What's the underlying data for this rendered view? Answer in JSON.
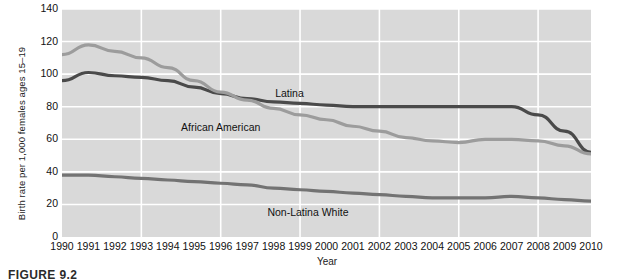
{
  "figure": {
    "caption": "FIGURE 9.2"
  },
  "chart_data": {
    "type": "line",
    "title": "",
    "xlabel": "Year",
    "ylabel": "Birth rate per 1,000 females ages 15–19",
    "xlim": [
      1990,
      2010
    ],
    "ylim": [
      0,
      140
    ],
    "yticks": [
      140,
      120,
      100,
      80,
      60,
      40,
      20,
      0
    ],
    "grid": true,
    "grid_color": "#ffffff",
    "plot_background": "#d9d9d9",
    "legend": "inline-labels",
    "x": [
      1990,
      1991,
      1992,
      1993,
      1994,
      1995,
      1996,
      1997,
      1998,
      1999,
      2000,
      2001,
      2002,
      2003,
      2004,
      2005,
      2006,
      2007,
      2008,
      2009,
      2010
    ],
    "categories": [
      "1990",
      "1991",
      "1992",
      "1993",
      "1994",
      "1995",
      "1996",
      "1997",
      "1998",
      "1999",
      "2000",
      "2001",
      "2002",
      "2003",
      "2004",
      "2005",
      "2006",
      "2007",
      "2008",
      "2009",
      "2010"
    ],
    "series": [
      {
        "name": "Latina",
        "color": "#4a4a4a",
        "label_x": 1998.6,
        "label_y": 88,
        "values": [
          96,
          101,
          99,
          98,
          96,
          92,
          88,
          85,
          83,
          82,
          81,
          80,
          80,
          80,
          80,
          80,
          80,
          80,
          75,
          65,
          52
        ]
      },
      {
        "name": "African American",
        "color": "#9c9c9c",
        "label_x": 1996.0,
        "label_y": 67,
        "values": [
          112,
          118,
          114,
          110,
          104,
          96,
          89,
          84,
          79,
          75,
          72,
          68,
          65,
          61,
          59,
          58,
          60,
          60,
          59,
          56,
          51
        ]
      },
      {
        "name": "Non-Latina White",
        "color": "#737373",
        "label_x": 1999.3,
        "label_y": 15,
        "values": [
          38,
          38,
          37,
          36,
          35,
          34,
          33,
          32,
          30,
          29,
          28,
          27,
          26,
          25,
          24,
          24,
          24,
          25,
          24,
          23,
          22
        ]
      }
    ]
  }
}
